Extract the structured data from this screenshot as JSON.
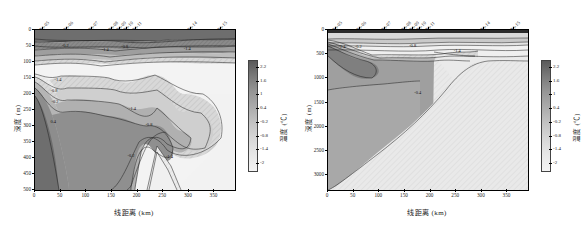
{
  "figure": {
    "panels": [
      {
        "id": "left",
        "axis": {
          "xlabel": "线距离 (km)",
          "ylabel": "深度 (m)",
          "xticks": [
            "0",
            "50",
            "100",
            "150",
            "200",
            "250",
            "300",
            "350"
          ],
          "xtick_values": [
            0,
            50,
            100,
            150,
            200,
            250,
            300,
            350
          ],
          "yticks": [
            "0",
            "50",
            "100",
            "150",
            "200",
            "250",
            "300",
            "350",
            "400",
            "450",
            "500"
          ],
          "ytick_values": [
            0,
            50,
            100,
            150,
            200,
            250,
            300,
            350,
            400,
            450,
            500
          ],
          "xlim": [
            0,
            390
          ],
          "ylim": [
            0,
            500
          ]
        },
        "stations": [
          {
            "label": "P3-05",
            "x": 15
          },
          {
            "label": "P3-06",
            "x": 62
          },
          {
            "label": "P3-07",
            "x": 112
          },
          {
            "label": "P3-08",
            "x": 150
          },
          {
            "label": "P3-09",
            "x": 165
          },
          {
            "label": "P3-10",
            "x": 180
          },
          {
            "label": "P3-11",
            "x": 196
          },
          {
            "label": "P3-14",
            "x": 305
          },
          {
            "label": "P3-15",
            "x": 363
          }
        ],
        "contour_labels": [
          {
            "text": "-0.2",
            "x": 62,
            "y": 48
          },
          {
            "text": "-1.4",
            "x": 140,
            "y": 58
          },
          {
            "text": "-0.8",
            "x": 178,
            "y": 50
          },
          {
            "text": "-1.4",
            "x": 300,
            "y": 56
          },
          {
            "text": "-1.4",
            "x": 48,
            "y": 152
          },
          {
            "text": "-0.8",
            "x": 40,
            "y": 186
          },
          {
            "text": "-0.2",
            "x": 42,
            "y": 222
          },
          {
            "text": "0.4",
            "x": 40,
            "y": 283
          },
          {
            "text": "-1.4",
            "x": 193,
            "y": 245
          },
          {
            "text": "-0.8",
            "x": 225,
            "y": 293
          },
          {
            "text": "-0.2",
            "x": 190,
            "y": 390
          },
          {
            "text": "-1.4",
            "x": 265,
            "y": 395
          }
        ],
        "colorbar": {
          "label": "温度 (℃)",
          "ticks": [
            "2.2",
            "1.6",
            "1",
            "0.4",
            "-0.2",
            "-0.8",
            "-1.4",
            "-2"
          ],
          "tick_values": [
            2.2,
            1.6,
            1,
            0.4,
            -0.2,
            -0.8,
            -1.4,
            -2
          ],
          "vmin": -2.3,
          "vmax": 2.5
        }
      },
      {
        "id": "right",
        "axis": {
          "xlabel": "线距离 (km)",
          "ylabel": "深度 (m)",
          "xticks": [
            "0",
            "50",
            "100",
            "150",
            "200",
            "250",
            "300",
            "350"
          ],
          "xtick_values": [
            0,
            50,
            100,
            150,
            200,
            250,
            300,
            350
          ],
          "yticks": [
            "0",
            "500",
            "1000",
            "1500",
            "2000",
            "2500",
            "3000"
          ],
          "ytick_values": [
            0,
            500,
            1000,
            1500,
            2000,
            2500,
            3000
          ],
          "xlim": [
            0,
            390
          ],
          "ylim": [
            0,
            3300
          ]
        },
        "stations": [
          {
            "label": "P3-05",
            "x": 15
          },
          {
            "label": "P3-06",
            "x": 62
          },
          {
            "label": "P3-07",
            "x": 112
          },
          {
            "label": "P3-08",
            "x": 150
          },
          {
            "label": "P3-09",
            "x": 165
          },
          {
            "label": "P3-10",
            "x": 180
          },
          {
            "label": "P3-11",
            "x": 196
          },
          {
            "label": "P3-14",
            "x": 305
          },
          {
            "label": "P3-15",
            "x": 363
          }
        ],
        "contour_labels": [
          {
            "text": "-1.4",
            "x": 30,
            "y": 330
          },
          {
            "text": "-0.2",
            "x": 62,
            "y": 320
          },
          {
            "text": "-0.8",
            "x": 168,
            "y": 310
          },
          {
            "text": "-1.4",
            "x": 255,
            "y": 420
          },
          {
            "text": "-0.4",
            "x": 178,
            "y": 1280
          }
        ],
        "colorbar": {
          "label": "温度 (℃)",
          "ticks": [
            "2.2",
            "1.6",
            "1",
            "0.4",
            "-0.2",
            "-0.8",
            "-1.4",
            "-2"
          ],
          "tick_values": [
            2.2,
            1.6,
            1,
            0.4,
            -0.2,
            -0.8,
            -1.4,
            -2
          ],
          "vmin": -2.3,
          "vmax": 2.5
        }
      }
    ]
  },
  "chart_data": {
    "type": "heatmap",
    "title": "",
    "variable": "温度 (℃)",
    "xlabel": "线距离 (km)",
    "ylabel": "深度 (m)",
    "grid": false,
    "legend_position": "right-colorbar",
    "colorbar": {
      "label": "温度 (℃)",
      "ticks": [
        2.2,
        1.6,
        1.0,
        0.4,
        -0.2,
        -0.8,
        -1.4,
        -2.0
      ],
      "vmin": -2.3,
      "vmax": 2.5,
      "orientation": "vertical",
      "colormap": "grayscale-dark-high-to-light-low"
    },
    "contour_levels": [
      -2.0,
      -1.4,
      -0.8,
      -0.2,
      0.4,
      1.0,
      1.6,
      2.2
    ],
    "stations": [
      "P3-05",
      "P3-06",
      "P3-07",
      "P3-08",
      "P3-09",
      "P3-10",
      "P3-11",
      "P3-14",
      "P3-15"
    ],
    "station_x_km": [
      15,
      62,
      112,
      150,
      165,
      180,
      196,
      305,
      363
    ],
    "panels": [
      {
        "name": "upper 500 m section",
        "xlim": [
          0,
          390
        ],
        "ylim": [
          0,
          500
        ],
        "y_inverted": true,
        "xticks": [
          0,
          50,
          100,
          150,
          200,
          250,
          300,
          350
        ],
        "yticks": [
          0,
          50,
          100,
          150,
          200,
          250,
          300,
          350,
          400,
          450,
          500
        ],
        "labeled_contours": [
          -0.2,
          -1.4,
          -0.8,
          0.4
        ],
        "features": [
          "Warm (dark) surface layer 0-30 m across entire transect",
          "Cold (light) minimum layer approx 60-150 m between 0 and 390 km",
          "Warm water intrusion near the shelf at x < 30 km extending to 500 m",
          "Contour -1.4 at about 150 m depth near x = 10 km rising toward 60 m offshore",
          "A cold wedge (light hatched) at x = 200-255 km reaching 500 m"
        ]
      },
      {
        "name": "full depth section",
        "xlim": [
          0,
          390
        ],
        "ylim": [
          0,
          3300
        ],
        "y_inverted": true,
        "xticks": [
          0,
          50,
          100,
          150,
          200,
          250,
          300,
          350
        ],
        "yticks": [
          0,
          500,
          1000,
          1500,
          2000,
          2500,
          3000
        ],
        "labeled_contours": [
          -1.4,
          -0.2,
          -0.8,
          -0.4
        ],
        "features": [
          "Thin warm surface layer 0-100 m",
          "Shelf slope rising from about 3300 m at x = 0 km to the surface near x = 205 km",
          "Warmer intermediate water (darker) on the slope between 0 and 200 km",
          "Deep basin east of 205 km filled with uniform cold (light) water",
          "Contour -0.4 descends from 1300 m at x = 180 km to 1600 m at x = 0 km"
        ]
      }
    ]
  }
}
